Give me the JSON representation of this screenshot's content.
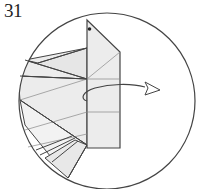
{
  "step": {
    "number": "31"
  },
  "diagram": {
    "circle": {
      "cx": 107,
      "cy": 101,
      "r": 88
    },
    "colors": {
      "stroke": "#444444",
      "paper_fill": "#ececec",
      "thin_line": "#888888",
      "background": "#ffffff"
    },
    "instruction": "Turn the flap over to the right (arrow)",
    "marker": "dot at top of flap"
  }
}
